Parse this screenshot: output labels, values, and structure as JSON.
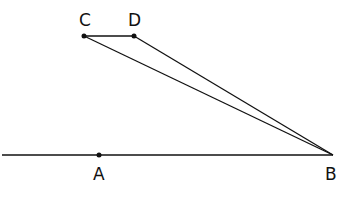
{
  "diagram": {
    "points": {
      "A": {
        "label": "A",
        "x": 99,
        "y": 155
      },
      "B": {
        "label": "B",
        "x": 333,
        "y": 155
      },
      "C": {
        "label": "C",
        "x": 84,
        "y": 36
      },
      "D": {
        "label": "D",
        "x": 134,
        "y": 36
      }
    },
    "segments": [
      {
        "from": "line-start",
        "to": "B",
        "note": "horizontal line through A to B"
      },
      {
        "from": "C",
        "to": "D"
      },
      {
        "from": "C",
        "to": "B"
      },
      {
        "from": "D",
        "to": "B"
      }
    ],
    "colors": {
      "stroke": "#111111",
      "background": "#ffffff"
    }
  }
}
